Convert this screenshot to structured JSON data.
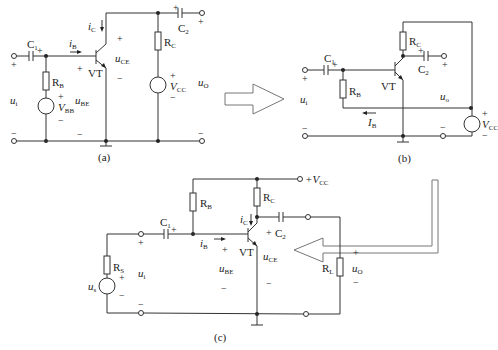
{
  "figure": {
    "panels": [
      {
        "id": "a",
        "caption": "(a)",
        "components": {
          "C1": "C",
          "C1_sub": "1",
          "C2": "C",
          "C2_sub": "2",
          "RB": "R",
          "RB_sub": "B",
          "RC": "R",
          "RC_sub": "C",
          "VBB": "V",
          "VBB_sub": "BB",
          "VCC": "V",
          "VCC_sub": "CC",
          "VT": "VT"
        },
        "labels": {
          "iB": "i",
          "iB_sub": "B",
          "iC": "i",
          "iC_sub": "C",
          "ui": "u",
          "ui_sub": "i",
          "uBE": "u",
          "uBE_sub": "BE",
          "uCE": "u",
          "uCE_sub": "CE",
          "uO": "u",
          "uO_sub": "O"
        }
      },
      {
        "id": "b",
        "caption": "(b)",
        "components": {
          "C1": "C",
          "C1_sub": "1",
          "C2": "C",
          "C2_sub": "2",
          "RB": "R",
          "RB_sub": "B",
          "RC": "R",
          "RC_sub": "C",
          "VCC": "V",
          "VCC_sub": "CC",
          "VT": "VT"
        },
        "labels": {
          "IB": "I",
          "IB_sub": "B",
          "ui": "u",
          "ui_sub": "i",
          "uo": "u",
          "uo_sub": "o"
        }
      },
      {
        "id": "c",
        "caption": "(c)",
        "components": {
          "C1": "C",
          "C1_sub": "1",
          "C2": "C",
          "C2_sub": "2",
          "RB": "R",
          "RB_sub": "B",
          "RC": "R",
          "RC_sub": "C",
          "RS": "R",
          "RS_sub": "S",
          "RL": "R",
          "RL_sub": "L",
          "us": "u",
          "us_sub": "s",
          "VCC_supply": "+V",
          "VCC_supply_sub": "CC",
          "VT": "VT"
        },
        "labels": {
          "iB": "i",
          "iB_sub": "B",
          "iC": "i",
          "iC_sub": "C",
          "ui": "u",
          "ui_sub": "i",
          "uBE": "u",
          "uBE_sub": "BE",
          "uCE": "u",
          "uCE_sub": "CE",
          "uO": "u",
          "uO_sub": "O"
        }
      }
    ],
    "signs": {
      "plus": "+",
      "minus": "−"
    }
  }
}
